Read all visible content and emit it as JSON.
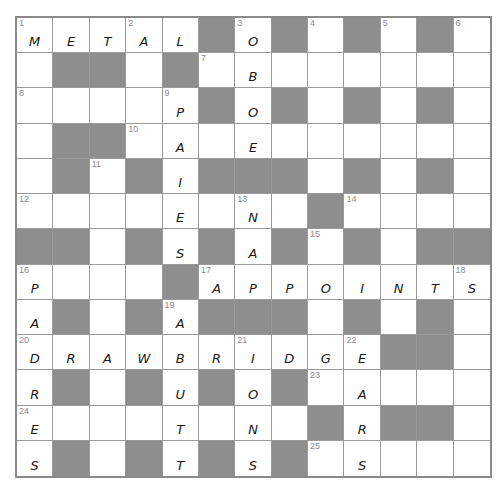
{
  "puzzle": {
    "rows": 13,
    "cols": 13,
    "colors": {
      "block": "#8e8e8e",
      "cell": "#ffffff",
      "grid_line": "#9a9a9a",
      "number": "#8c8c8c",
      "ink": "#1a1a1a"
    },
    "grid": [
      [
        {
          "n": "1",
          "l": "M"
        },
        {
          "l": "E"
        },
        {
          "l": "T"
        },
        {
          "n": "2",
          "l": "A"
        },
        {
          "l": "L"
        },
        {
          "b": 1
        },
        {
          "n": "3",
          "l": "O"
        },
        {
          "b": 1
        },
        {
          "n": "4"
        },
        {
          "b": 1
        },
        {
          "n": "5"
        },
        {
          "b": 1
        },
        {
          "n": "6"
        }
      ],
      [
        {},
        {
          "b": 1
        },
        {
          "b": 1
        },
        {},
        {
          "b": 1
        },
        {
          "n": "7"
        },
        {
          "l": "B"
        },
        {},
        {},
        {},
        {},
        {},
        {}
      ],
      [
        {
          "n": "8"
        },
        {},
        {},
        {},
        {
          "n": "9",
          "l": "P"
        },
        {
          "b": 1
        },
        {
          "l": "O"
        },
        {
          "b": 1
        },
        {},
        {
          "b": 1
        },
        {},
        {
          "b": 1
        },
        {}
      ],
      [
        {},
        {
          "b": 1
        },
        {
          "b": 1
        },
        {
          "n": "10"
        },
        {
          "l": "A"
        },
        {},
        {
          "l": "E"
        },
        {},
        {},
        {},
        {},
        {},
        {}
      ],
      [
        {},
        {
          "b": 1
        },
        {
          "n": "11"
        },
        {
          "b": 1
        },
        {
          "l": "I"
        },
        {
          "b": 1
        },
        {
          "b": 1
        },
        {
          "b": 1
        },
        {},
        {
          "b": 1
        },
        {},
        {
          "b": 1
        },
        {}
      ],
      [
        {
          "n": "12"
        },
        {},
        {},
        {},
        {
          "l": "E"
        },
        {},
        {
          "n": "13",
          "l": "N"
        },
        {},
        {
          "b": 1
        },
        {
          "n": "14"
        },
        {},
        {},
        {}
      ],
      [
        {
          "b": 1
        },
        {
          "b": 1
        },
        {},
        {
          "b": 1
        },
        {
          "l": "S"
        },
        {
          "b": 1
        },
        {
          "l": "A"
        },
        {
          "b": 1
        },
        {
          "n": "15"
        },
        {
          "b": 1
        },
        {},
        {
          "b": 1
        },
        {
          "b": 1
        }
      ],
      [
        {
          "n": "16",
          "l": "P"
        },
        {},
        {},
        {},
        {
          "b": 1
        },
        {
          "n": "17",
          "l": "A"
        },
        {
          "l": "P"
        },
        {
          "l": "P"
        },
        {
          "l": "O"
        },
        {
          "l": "I"
        },
        {
          "l": "N"
        },
        {
          "l": "T"
        },
        {
          "n": "18",
          "l": "S"
        }
      ],
      [
        {
          "l": "A"
        },
        {
          "b": 1
        },
        {},
        {
          "b": 1
        },
        {
          "n": "19",
          "l": "A"
        },
        {
          "b": 1
        },
        {
          "b": 1
        },
        {
          "b": 1
        },
        {},
        {
          "b": 1
        },
        {},
        {
          "b": 1
        },
        {}
      ],
      [
        {
          "n": "20",
          "l": "D"
        },
        {
          "l": "R"
        },
        {
          "l": "A"
        },
        {
          "l": "W"
        },
        {
          "l": "B"
        },
        {
          "l": "R"
        },
        {
          "n": "21",
          "l": "I"
        },
        {
          "l": "D"
        },
        {
          "l": "G"
        },
        {
          "n": "22",
          "l": "E"
        },
        {
          "b": 1
        },
        {
          "b": 1
        },
        {}
      ],
      [
        {
          "l": "R"
        },
        {
          "b": 1
        },
        {},
        {
          "b": 1
        },
        {
          "l": "U"
        },
        {
          "b": 1
        },
        {
          "l": "O"
        },
        {
          "b": 1
        },
        {
          "n": "23"
        },
        {
          "l": "A"
        },
        {},
        {},
        {}
      ],
      [
        {
          "n": "24",
          "l": "E"
        },
        {},
        {},
        {},
        {
          "l": "T"
        },
        {},
        {
          "l": "N"
        },
        {},
        {
          "b": 1
        },
        {
          "l": "R"
        },
        {
          "b": 1
        },
        {
          "b": 1
        },
        {}
      ],
      [
        {
          "l": "S"
        },
        {
          "b": 1
        },
        {},
        {
          "b": 1
        },
        {
          "l": "T"
        },
        {
          "b": 1
        },
        {
          "l": "S"
        },
        {
          "b": 1
        },
        {
          "n": "25"
        },
        {
          "l": "S"
        },
        {},
        {},
        {}
      ]
    ]
  }
}
